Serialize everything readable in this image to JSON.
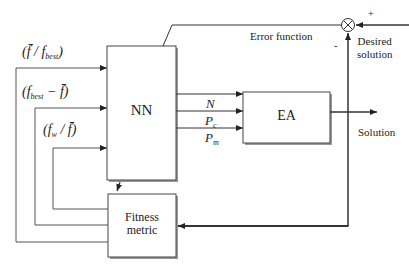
{
  "blocks": {
    "nn": "NN",
    "ea": "EA",
    "fitness_line1": "Fitness",
    "fitness_line2": "metric"
  },
  "labels": {
    "error_function": "Error function",
    "desired_line1": "Desired",
    "desired_line2": "solution",
    "solution": "Solution",
    "plus": "+",
    "minus": "-"
  },
  "feedback_inputs": [
    {
      "text": "(f̄ / f",
      "sub": "best",
      "close": ")"
    },
    {
      "text": "(f",
      "sub": "best",
      "close": " − f̄)"
    },
    {
      "text": "(f",
      "sub": "w",
      "close": " / f̄)"
    }
  ],
  "ea_params": [
    {
      "main": "N",
      "sub": ""
    },
    {
      "main": "P",
      "sub": "c"
    },
    {
      "main": "P",
      "sub": "m"
    }
  ],
  "colors": {
    "line": "#333333",
    "box_shadow": "#888888"
  }
}
